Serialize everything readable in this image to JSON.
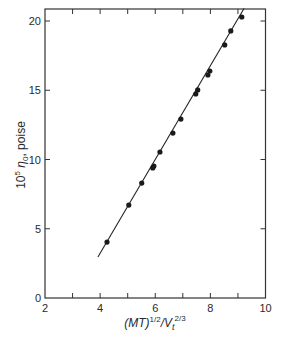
{
  "chart_data": {
    "type": "scatter",
    "title": "",
    "xlabel": "(MT)^1/2 / Vt^2/3",
    "xlabel_parts": {
      "base": "(MT)",
      "sup1": "1/2",
      "mid": "/V",
      "sub": "t",
      "sup2": "2/3"
    },
    "ylabel": "10^5 η0, poise",
    "ylabel_parts": {
      "base": "10",
      "sup": "5",
      "sym": " η",
      "sub": "0",
      "rest": ", poise"
    },
    "xlim": [
      2,
      10
    ],
    "ylim": [
      0,
      20.9
    ],
    "xticks": [
      2,
      4,
      6,
      8,
      10
    ],
    "xticks_minor": [
      3,
      5,
      7,
      9
    ],
    "yticks": [
      0,
      5,
      10,
      15,
      20
    ],
    "grid": false,
    "legend": null,
    "series": [
      {
        "name": "data",
        "marker": "filled-circle",
        "points": [
          [
            4.25,
            4.04
          ],
          [
            5.04,
            6.71
          ],
          [
            5.51,
            8.3
          ],
          [
            5.91,
            9.39
          ],
          [
            5.95,
            9.53
          ],
          [
            6.17,
            10.54
          ],
          [
            6.64,
            11.91
          ],
          [
            6.93,
            12.92
          ],
          [
            7.47,
            14.73
          ],
          [
            7.54,
            15.02
          ],
          [
            7.91,
            16.1
          ],
          [
            7.98,
            16.39
          ],
          [
            8.52,
            18.27
          ],
          [
            8.74,
            19.28
          ],
          [
            9.14,
            20.29
          ]
        ]
      },
      {
        "name": "fit line",
        "type": "line",
        "points": [
          [
            3.92,
            2.96
          ],
          [
            9.22,
            20.9
          ]
        ]
      }
    ]
  }
}
